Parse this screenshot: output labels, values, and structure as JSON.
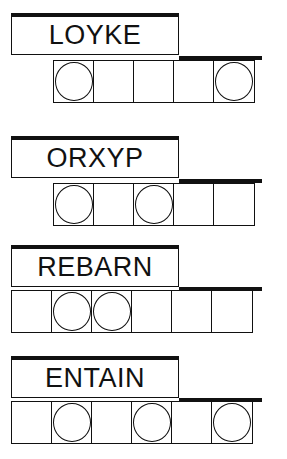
{
  "puzzles": [
    {
      "scrambled": "LOYKE",
      "cells": 5,
      "cell_offset": 1,
      "circled": [
        0,
        4
      ]
    },
    {
      "scrambled": "ORXYP",
      "cells": 5,
      "cell_offset": 1,
      "circled": [
        0,
        2
      ]
    },
    {
      "scrambled": "REBARN",
      "cells": 6,
      "cell_offset": 0,
      "circled": [
        1,
        2
      ]
    },
    {
      "scrambled": "ENTAIN",
      "cells": 6,
      "cell_offset": 0,
      "circled": [
        1,
        3,
        5
      ]
    }
  ],
  "colors": {
    "ink": "#111111",
    "background": "#ffffff"
  }
}
